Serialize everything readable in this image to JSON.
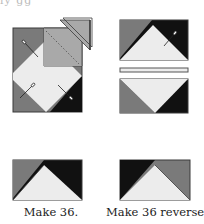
{
  "header": {
    "cropped_text": "ly gg"
  },
  "colors": {
    "medium_gray": "#7a7a7a",
    "light_gray": "#a9a9a9",
    "light_fill": "#ececec",
    "black": "#111111",
    "outline": "#3a3a3a"
  },
  "figures": {
    "step_sew": {
      "description": "Square unit with folded triangle being pinned and stitched on diagonal"
    },
    "step_strip": {
      "description": "Two rectangle units with a connecting strip between them"
    },
    "results": [
      {
        "label": "Make 36.",
        "orientation": "standard"
      },
      {
        "label": "Make 36 reversed.",
        "orientation": "reversed"
      }
    ]
  }
}
